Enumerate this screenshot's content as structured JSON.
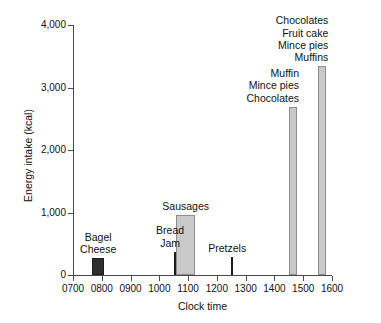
{
  "chart_data": {
    "type": "bar",
    "title": "",
    "subtitle": "",
    "xlabel": "Clock time",
    "ylabel": "Energy intake (kcal)",
    "xlim": [
      700,
      1600
    ],
    "ylim": [
      0,
      4000
    ],
    "grid": false,
    "legend": "none",
    "y_ticks": [
      "0",
      "1,000",
      "2,000",
      "3,000",
      "4,000"
    ],
    "y_tick_values": [
      0,
      1000,
      2000,
      3000,
      4000
    ],
    "x_ticks": [
      "0700",
      "0800",
      "0900",
      "1000",
      "1100",
      "1200",
      "1300",
      "1400",
      "1500",
      "1600"
    ],
    "x_tick_values": [
      700,
      800,
      900,
      1000,
      1100,
      1200,
      1300,
      1400,
      1500,
      1600
    ],
    "categories": [
      "0745",
      "1000",
      "1050",
      "1200",
      "1400",
      "1500"
    ],
    "values": [
      270,
      370,
      960,
      290,
      2690,
      3340
    ],
    "bars": [
      {
        "name": "bagel-cheese",
        "x_start": 740,
        "x_end": 765,
        "value": 270,
        "color": "#2e2e2e",
        "style": "dark",
        "labels": [
          "Bagel",
          "Cheese"
        ],
        "label_align": "center"
      },
      {
        "name": "bread-jam",
        "x_start": 990,
        "x_end": 1015,
        "value": 370,
        "color": "#2e2e2e",
        "style": "dark",
        "labels": [
          "Bread",
          "Jam"
        ],
        "label_align": "center"
      },
      {
        "name": "sausages",
        "x_start": 1035,
        "x_end": 1075,
        "value": 960,
        "color": "#c9c9c9",
        "style": "light",
        "labels": [
          "Sausages"
        ],
        "label_align": "center"
      },
      {
        "name": "pretzels",
        "x_start": 1190,
        "x_end": 1213,
        "value": 290,
        "color": "#2e2e2e",
        "style": "dark",
        "labels": [
          "Pretzels"
        ],
        "label_align": "center"
      },
      {
        "name": "muffin-mince-pies-chocolates",
        "x_start": 1390,
        "x_end": 1447,
        "value": 2690,
        "color": "#c9c9c9",
        "style": "light",
        "labels": [
          "Muffin",
          "Mince pies",
          "Chocolates"
        ],
        "label_align": "right"
      },
      {
        "name": "chocolates-fruit-cake-mince-pies-muffins",
        "x_start": 1490,
        "x_end": 1548,
        "value": 3340,
        "color": "#c9c9c9",
        "style": "light",
        "labels": [
          "Chocolates",
          "Fruit cake",
          "Mince pies",
          "Muffins"
        ],
        "label_align": "right"
      }
    ],
    "colors": {
      "dark_bar": "#2e2e2e",
      "light_bar": "#c9c9c9",
      "light_bar_border": "#8e8e8e",
      "axis": "#4a4a4a",
      "text": "#111111",
      "background": "#ffffff"
    }
  }
}
